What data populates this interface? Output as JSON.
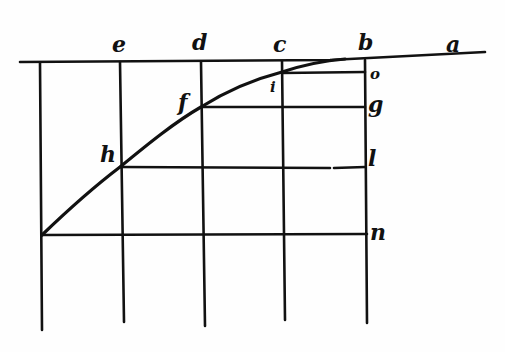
{
  "diagram": {
    "top_line_labels": [
      "e",
      "d",
      "c",
      "b",
      "a"
    ],
    "right_side_labels": [
      "o",
      "g",
      "l",
      "n"
    ],
    "curve_point_labels": [
      "h",
      "f",
      "i"
    ],
    "labels": {
      "a": "a",
      "b": "b",
      "c": "c",
      "d": "d",
      "e": "e",
      "f": "f",
      "g": "g",
      "h": "h",
      "i": "i",
      "l": "l",
      "n": "n",
      "o": "o"
    },
    "colors": {
      "ink": "#111111",
      "paper": "#fefefe"
    }
  }
}
